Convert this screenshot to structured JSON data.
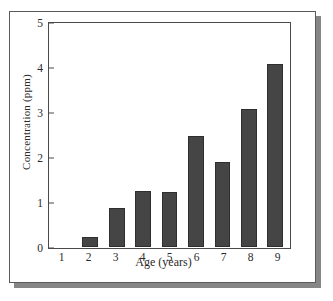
{
  "chart_data": {
    "type": "bar",
    "title": "",
    "xlabel": "Age (years)",
    "ylabel": "Concentration (ppm)",
    "categories": [
      "1",
      "2",
      "3",
      "4",
      "5",
      "6",
      "7",
      "8",
      "9"
    ],
    "values": [
      0,
      0.22,
      0.88,
      1.25,
      1.23,
      2.5,
      1.9,
      3.1,
      4.1
    ],
    "ylim": [
      0,
      5
    ],
    "yticks": [
      "0",
      "1",
      "2",
      "3",
      "4",
      "5"
    ],
    "ytick_values": [
      0,
      1,
      2,
      3,
      4,
      5
    ],
    "grid": false,
    "legend": false,
    "bar_color": "#454545",
    "axis_color": "#4a4a4a",
    "background_color": "#ffffff",
    "frame_shadow_color": "#868686"
  }
}
